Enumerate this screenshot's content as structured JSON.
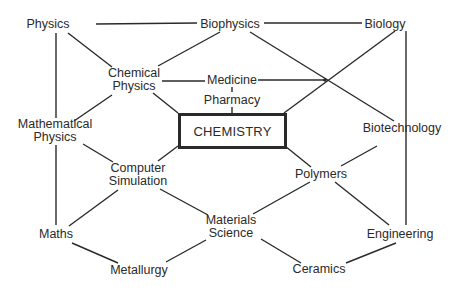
{
  "diagram": {
    "title": "CHEMISTRY",
    "style": {
      "line_color": "#2a2a2a",
      "text_color": "#2a2a2a",
      "background": "#ffffff"
    },
    "nodes": [
      {
        "id": "physics",
        "lines": [
          "Physics"
        ],
        "x": 48,
        "y": 24
      },
      {
        "id": "biophysics",
        "lines": [
          "Biophysics"
        ],
        "x": 230,
        "y": 24
      },
      {
        "id": "biology",
        "lines": [
          "Biology"
        ],
        "x": 385,
        "y": 24
      },
      {
        "id": "chemical-physics",
        "lines": [
          "Chemical",
          "Physics"
        ],
        "x": 134,
        "y": 80
      },
      {
        "id": "medicine",
        "lines": [
          "Medicine"
        ],
        "x": 232,
        "y": 80
      },
      {
        "id": "pharmacy",
        "lines": [
          "Pharmacy"
        ],
        "x": 232,
        "y": 100
      },
      {
        "id": "chemistry",
        "lines": [
          "CHEMISTRY"
        ],
        "x": 231,
        "y": 130
      },
      {
        "id": "mathematical-physics",
        "lines": [
          "Mathematical",
          "Physics"
        ],
        "x": 55,
        "y": 131
      },
      {
        "id": "biotechnology",
        "lines": [
          "Biotechnology"
        ],
        "x": 402,
        "y": 128
      },
      {
        "id": "computer-simulation",
        "lines": [
          "Computer",
          "Simulation"
        ],
        "x": 138,
        "y": 175
      },
      {
        "id": "polymers",
        "lines": [
          "Polymers"
        ],
        "x": 321,
        "y": 174
      },
      {
        "id": "maths",
        "lines": [
          "Maths"
        ],
        "x": 56,
        "y": 234
      },
      {
        "id": "materials-science",
        "lines": [
          "Materials",
          "Science"
        ],
        "x": 231,
        "y": 227
      },
      {
        "id": "engineering",
        "lines": [
          "Engineering"
        ],
        "x": 400,
        "y": 234
      },
      {
        "id": "metallurgy",
        "lines": [
          "Metallurgy"
        ],
        "x": 139,
        "y": 270
      },
      {
        "id": "ceramics",
        "lines": [
          "Ceramics"
        ],
        "x": 319,
        "y": 269
      }
    ],
    "edges": [
      [
        "physics",
        "biophysics"
      ],
      [
        "biophysics",
        "biology"
      ],
      [
        "physics",
        "chemical-physics"
      ],
      [
        "biophysics",
        "chemical-physics"
      ],
      [
        "physics",
        "mathematical-physics"
      ],
      [
        "chemical-physics",
        "medicine"
      ],
      [
        "medicine",
        "biology-biotech-crossing"
      ],
      [
        "biophysics",
        "biotechnology"
      ],
      [
        "biology",
        "chemistry"
      ],
      [
        "biology",
        "engineering"
      ],
      [
        "medicine",
        "pharmacy"
      ],
      [
        "pharmacy",
        "chemistry"
      ],
      [
        "chemical-physics",
        "chemistry"
      ],
      [
        "chemical-physics",
        "mathematical-physics"
      ],
      [
        "mathematical-physics",
        "computer-simulation"
      ],
      [
        "mathematical-physics",
        "maths"
      ],
      [
        "chemistry",
        "computer-simulation"
      ],
      [
        "chemistry",
        "polymers"
      ],
      [
        "biotechnology",
        "polymers"
      ],
      [
        "computer-simulation",
        "maths"
      ],
      [
        "computer-simulation",
        "materials-science"
      ],
      [
        "polymers",
        "materials-science"
      ],
      [
        "polymers",
        "engineering"
      ],
      [
        "maths",
        "metallurgy"
      ],
      [
        "materials-science",
        "metallurgy"
      ],
      [
        "materials-science",
        "ceramics"
      ],
      [
        "engineering",
        "ceramics"
      ]
    ],
    "segments": [
      [
        96,
        24,
        197,
        23
      ],
      [
        264,
        23,
        362,
        23
      ],
      [
        68,
        33,
        112,
        67
      ],
      [
        220,
        32,
        158,
        66
      ],
      [
        56,
        33,
        56,
        118
      ],
      [
        162,
        81,
        205,
        81
      ],
      [
        258,
        80,
        325,
        80
      ],
      [
        250,
        32,
        394,
        121
      ],
      [
        395,
        31,
        284,
        113
      ],
      [
        406,
        31,
        406,
        225
      ],
      [
        232,
        87,
        232,
        92
      ],
      [
        232,
        107,
        232,
        113
      ],
      [
        153,
        93,
        178,
        113
      ],
      [
        112,
        95,
        74,
        121
      ],
      [
        83,
        144,
        113,
        162
      ],
      [
        56,
        145,
        56,
        225
      ],
      [
        178,
        146,
        158,
        161
      ],
      [
        285,
        146,
        311,
        167
      ],
      [
        377,
        146,
        341,
        166
      ],
      [
        118,
        190,
        69,
        226
      ],
      [
        160,
        189,
        208,
        215
      ],
      [
        310,
        182,
        253,
        214
      ],
      [
        335,
        182,
        389,
        225
      ],
      [
        72,
        243,
        118,
        263
      ],
      [
        206,
        240,
        166,
        262
      ],
      [
        261,
        239,
        301,
        263
      ],
      [
        396,
        243,
        346,
        263
      ]
    ]
  }
}
